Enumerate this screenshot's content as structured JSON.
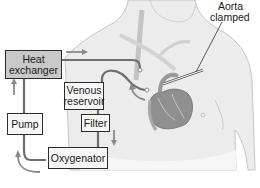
{
  "diagram": {
    "type": "cardiopulmonary-bypass-circuit",
    "components": [
      {
        "id": "heat_exchanger",
        "label_line1": "Heat",
        "label_line2": "exchanger"
      },
      {
        "id": "venous_reservoir",
        "label_line1": "Venous",
        "label_line2": "reservoir"
      },
      {
        "id": "filter",
        "label": "Filter"
      },
      {
        "id": "pump",
        "label": "Pump"
      },
      {
        "id": "oxygenator",
        "label": "Oxygenator"
      }
    ],
    "annotations": {
      "aorta_line1": "Aorta",
      "aorta_line2": "clamped"
    },
    "colors": {
      "tubing": "#6e6e6e",
      "arrow": "#8a8a8a",
      "box_fill_heat": "#c9c9c9",
      "box_fill_other": "#f7f7f7",
      "body": "#e4e4e4",
      "heart": "#8f8f8f"
    }
  }
}
